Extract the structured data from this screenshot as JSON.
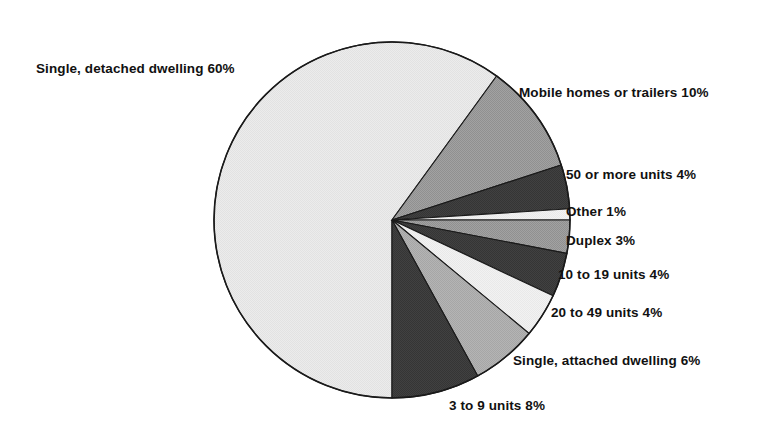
{
  "chart_data": {
    "type": "pie",
    "title": "",
    "subtitle": "",
    "xlabel": "",
    "ylabel": "",
    "legend_position": "none",
    "grid": false,
    "units": "percent",
    "start_angle_deg": 90,
    "direction": "clockwise",
    "categories": [
      "Single, detached dwelling",
      "Mobile homes or trailers",
      "50 or more units",
      "Other",
      "Duplex",
      "10 to 19 units",
      "20 to 49 units",
      "Single, attached dwelling",
      "3 to 9 units"
    ],
    "values": [
      60,
      10,
      4,
      1,
      3,
      4,
      4,
      6,
      8
    ],
    "slices": [
      {
        "name": "single-detached-dwelling",
        "label": "Single, detached dwelling 60%",
        "category": "Single, detached dwelling",
        "value": 60,
        "value_text": "60%",
        "color": "#e9e9e9"
      },
      {
        "name": "mobile-homes-or-trailers",
        "label": "Mobile homes or trailers 10%",
        "category": "Mobile homes or trailers",
        "value": 10,
        "value_text": "10%",
        "color": "#9b9b9b"
      },
      {
        "name": "50-or-more-units",
        "label": "50 or more units 4%",
        "category": "50 or more units",
        "value": 4,
        "value_text": "4%",
        "color": "#3b3b3b"
      },
      {
        "name": "other",
        "label": "Other 1%",
        "category": "Other",
        "value": 1,
        "value_text": "1%",
        "color": "#efefef"
      },
      {
        "name": "duplex",
        "label": "Duplex 3%",
        "category": "Duplex",
        "value": 3,
        "value_text": "3%",
        "color": "#9b9b9b"
      },
      {
        "name": "10-to-19-units",
        "label": "10 to 19 units 4%",
        "category": "10 to 19 units",
        "value": 4,
        "value_text": "4%",
        "color": "#3b3b3b"
      },
      {
        "name": "20-to-49-units",
        "label": "20 to 49 units 4%",
        "category": "20 to 49 units",
        "value": 4,
        "value_text": "4%",
        "color": "#efefef"
      },
      {
        "name": "single-attached-dwelling",
        "label": "Single, attached dwelling 6%",
        "category": "Single, attached dwelling",
        "value": 6,
        "value_text": "6%",
        "color": "#adadad"
      },
      {
        "name": "3-to-9-units",
        "label": "3 to 9 units 8%",
        "category": "3 to 9 units",
        "value": 8,
        "value_text": "8%",
        "color": "#3b3b3b"
      }
    ],
    "label_positions": [
      {
        "x": 36,
        "y": 62,
        "align": "left"
      },
      {
        "x": 519,
        "y": 86,
        "align": "right"
      },
      {
        "x": 566,
        "y": 168,
        "align": "right"
      },
      {
        "x": 566,
        "y": 205,
        "align": "right"
      },
      {
        "x": 566,
        "y": 234,
        "align": "right"
      },
      {
        "x": 558,
        "y": 268,
        "align": "right"
      },
      {
        "x": 551,
        "y": 306,
        "align": "right"
      },
      {
        "x": 513,
        "y": 354,
        "align": "right"
      },
      {
        "x": 449,
        "y": 399,
        "align": "right"
      }
    ],
    "geometry": {
      "center_x": 392,
      "center_y": 220,
      "radius": 178,
      "outline_color": "#1a1a1a"
    }
  }
}
